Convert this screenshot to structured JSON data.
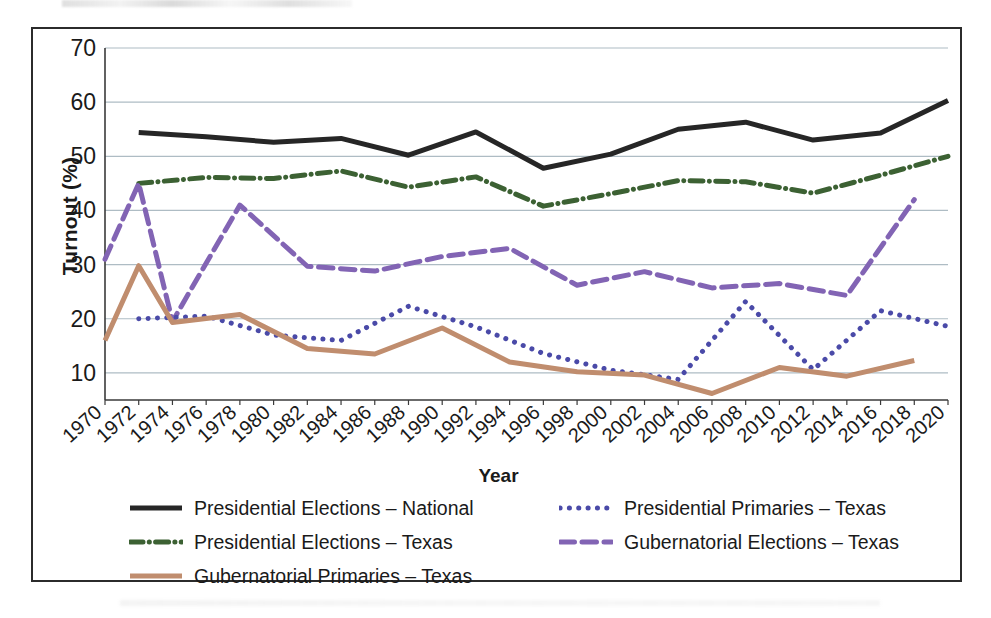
{
  "figure": {
    "y_axis_title": "Turnout (%)",
    "x_axis_title": "Year"
  },
  "legend": {
    "rows": [
      [
        {
          "label": "Presidential Elections – National",
          "key": "pres_nat"
        },
        {
          "label": "Presidential Primaries – Texas",
          "key": "pres_prim_tx"
        }
      ],
      [
        {
          "label": "Presidential Elections – Texas",
          "key": "pres_tx"
        },
        {
          "label": "Gubernatorial Elections – Texas",
          "key": "gub_elec_tx"
        }
      ],
      [
        {
          "label": "Gubernatorial Primaries – Texas",
          "key": "gub_prim_tx"
        }
      ]
    ]
  },
  "chart_data": {
    "type": "line",
    "title": "",
    "xlabel": "Year",
    "ylabel": "Turnout (%)",
    "xlim": [
      1970,
      2020
    ],
    "ylim": [
      5,
      70
    ],
    "yticks": [
      10,
      20,
      30,
      40,
      50,
      60,
      70
    ],
    "grid": "horizontal",
    "legend_position": "bottom",
    "x": [
      1970,
      1972,
      1974,
      1976,
      1978,
      1980,
      1982,
      1984,
      1986,
      1988,
      1990,
      1992,
      1994,
      1996,
      1998,
      2000,
      2002,
      2004,
      2006,
      2008,
      2010,
      2012,
      2014,
      2016,
      2018,
      2020
    ],
    "categories": [
      "1970",
      "1972",
      "1974",
      "1976",
      "1978",
      "1980",
      "1982",
      "1984",
      "1986",
      "1988",
      "1990",
      "1992",
      "1994",
      "1996",
      "1998",
      "2000",
      "2002",
      "2004",
      "2006",
      "2008",
      "2010",
      "2012",
      "2014",
      "2016",
      "2018",
      "2020"
    ],
    "series": [
      {
        "name": "Presidential Elections – National",
        "key": "pres_nat",
        "color": "#262626",
        "style": "solid",
        "width": 5,
        "x": [
          1972,
          1976,
          1980,
          1984,
          1988,
          1992,
          1996,
          2000,
          2004,
          2008,
          2012,
          2016,
          2020
        ],
        "values": [
          54.4,
          53.6,
          52.6,
          53.3,
          50.2,
          54.5,
          47.8,
          50.4,
          55.0,
          56.3,
          53.0,
          54.3,
          60.3
        ]
      },
      {
        "name": "Presidential Elections – Texas",
        "key": "pres_tx",
        "color": "#3c6133",
        "style": "dashdot",
        "width": 5,
        "x": [
          1972,
          1976,
          1980,
          1984,
          1988,
          1992,
          1996,
          2000,
          2004,
          2008,
          2012,
          2016,
          2020
        ],
        "values": [
          45.0,
          46.1,
          45.9,
          47.3,
          44.3,
          46.2,
          40.8,
          43.1,
          45.5,
          45.3,
          43.2,
          46.5,
          50.0
        ]
      },
      {
        "name": "Gubernatorial Elections – Texas",
        "key": "gub_elec_tx",
        "color": "#8264b4",
        "style": "dashed",
        "width": 5,
        "x": [
          1970,
          1972,
          1974,
          1978,
          1982,
          1986,
          1990,
          1994,
          1998,
          2002,
          2006,
          2010,
          2014,
          2018
        ],
        "values": [
          31.0,
          45.0,
          19.5,
          41.0,
          29.7,
          28.8,
          31.5,
          33.0,
          26.2,
          28.7,
          25.7,
          26.5,
          24.3,
          42.0
        ]
      },
      {
        "name": "Presidential Primaries – Texas",
        "key": "pres_prim_tx",
        "color": "#4a4aa8",
        "style": "dotted",
        "width": 5,
        "x": [
          1972,
          1976,
          1980,
          1984,
          1988,
          1992,
          1996,
          2000,
          2004,
          2008,
          2012,
          2016,
          2020
        ],
        "values": [
          20.0,
          20.5,
          17.0,
          16.0,
          22.3,
          18.5,
          13.6,
          10.5,
          8.8,
          23.2,
          10.6,
          21.5,
          18.6
        ]
      },
      {
        "name": "Gubernatorial Primaries – Texas",
        "key": "gub_prim_tx",
        "color": "#c08d6e",
        "style": "solid",
        "width": 5,
        "x": [
          1970,
          1972,
          1974,
          1978,
          1982,
          1986,
          1990,
          1994,
          1998,
          2002,
          2006,
          2010,
          2014,
          2018
        ],
        "values": [
          16.0,
          29.8,
          19.3,
          20.8,
          14.5,
          13.5,
          18.3,
          12.0,
          10.2,
          9.6,
          6.2,
          11.0,
          9.4,
          12.3
        ]
      }
    ]
  }
}
